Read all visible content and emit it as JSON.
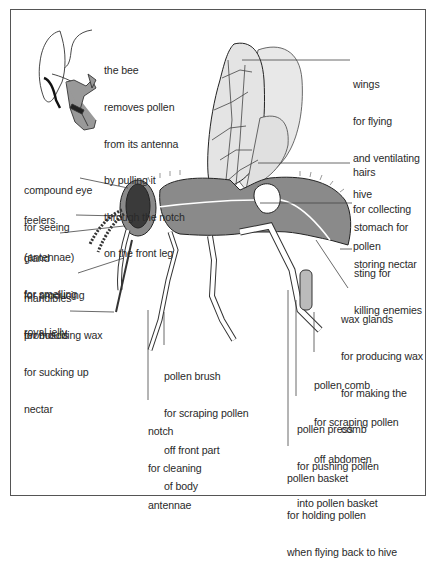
{
  "diagram": {
    "inset_caption": [
      "the bee",
      "removes pollen",
      "from its antenna",
      "by pulling it",
      "through the notch",
      "on the front leg"
    ],
    "labels": {
      "wings": [
        "wings",
        "for flying",
        "and ventilating",
        "hive"
      ],
      "hairs": [
        "hairs",
        "for collecting",
        "pollen"
      ],
      "compound_eye": [
        "compound eye",
        "for seeing"
      ],
      "feelers": [
        "feelers",
        "(antennae)",
        "for smelling"
      ],
      "gland": [
        "gland",
        "for producing",
        "royal jelly"
      ],
      "mandibles": [
        "mandibles",
        "for moulding wax"
      ],
      "proboscis": [
        "proboscis",
        "for sucking up",
        "nectar"
      ],
      "stomach": [
        "stomach for",
        "storing nectar"
      ],
      "sting": [
        "sting for",
        "killing enemies"
      ],
      "wax_glands": [
        "wax glands",
        "for producing wax",
        "for making the",
        "comb"
      ],
      "pollen_brush": [
        "pollen brush",
        "for scraping pollen",
        "off front part",
        "of body"
      ],
      "notch": [
        "notch",
        "for cleaning",
        "antennae"
      ],
      "pollen_comb": [
        "pollen comb",
        "for scraping pollen",
        "off abdomen"
      ],
      "pollen_press": [
        "pollen press",
        "for pushing pollen",
        "into pollen basket"
      ],
      "pollen_basket": [
        "pollen basket",
        "for holding pollen",
        "when flying back to hive"
      ]
    },
    "colors": {
      "body_fill": "#8a8a8a",
      "wing_fill": "#e4e4e4",
      "line": "#333333",
      "eye_fill": "#3a3a3a"
    }
  }
}
